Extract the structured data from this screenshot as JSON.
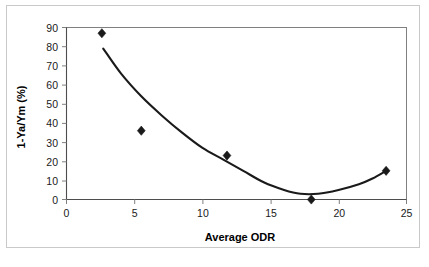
{
  "chart_data": {
    "type": "scatter",
    "title": "",
    "xlabel": "Average ODR",
    "ylabel": "1-Ya/Ym (%)",
    "xlim": [
      0,
      25
    ],
    "ylim": [
      0,
      90
    ],
    "xticks": [
      0,
      5,
      10,
      15,
      20,
      25
    ],
    "yticks": [
      0,
      10,
      20,
      30,
      40,
      50,
      60,
      70,
      80,
      90
    ],
    "xtick_labels": [
      "0",
      "5",
      "10",
      "15",
      "20",
      "25"
    ],
    "ytick_labels": [
      "0",
      "10",
      "20",
      "30",
      "40",
      "50",
      "60",
      "70",
      "80",
      "90"
    ],
    "grid": false,
    "legend": false,
    "marker": "diamond",
    "marker_color": "#1a1a1a",
    "series": [
      {
        "name": "Observations",
        "type": "scatter",
        "points": [
          {
            "x": 2.6,
            "y": 87
          },
          {
            "x": 5.5,
            "y": 36
          },
          {
            "x": 11.8,
            "y": 23
          },
          {
            "x": 18.0,
            "y": 0
          },
          {
            "x": 23.5,
            "y": 15
          }
        ]
      },
      {
        "name": "Fitted trend curve",
        "type": "line",
        "curve": "polynomial",
        "points": [
          {
            "x": 2.7,
            "y": 79
          },
          {
            "x": 4.0,
            "y": 66
          },
          {
            "x": 5.5,
            "y": 54
          },
          {
            "x": 7.0,
            "y": 44
          },
          {
            "x": 8.5,
            "y": 35
          },
          {
            "x": 10.0,
            "y": 27
          },
          {
            "x": 11.5,
            "y": 21
          },
          {
            "x": 13.0,
            "y": 15
          },
          {
            "x": 14.5,
            "y": 9
          },
          {
            "x": 16.0,
            "y": 5
          },
          {
            "x": 17.2,
            "y": 3
          },
          {
            "x": 18.5,
            "y": 3
          },
          {
            "x": 20.0,
            "y": 5
          },
          {
            "x": 21.5,
            "y": 8
          },
          {
            "x": 22.5,
            "y": 11
          },
          {
            "x": 23.5,
            "y": 15
          }
        ]
      }
    ]
  },
  "axes": {
    "x_title": "Average ODR",
    "y_title": "1-Ya/Ym (%)"
  }
}
